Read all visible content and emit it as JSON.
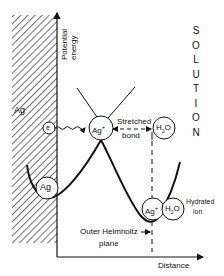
{
  "diagram": {
    "type": "potential energy diagram",
    "axes": {
      "y_label": [
        "Potential",
        "energy"
      ],
      "x_label": "Distance"
    },
    "regions": {
      "metal_label": "Ag",
      "solution_label": "SOLUTION",
      "solution_letters": [
        "S",
        "O",
        "L",
        "U",
        "T",
        "I",
        "O",
        "N"
      ]
    },
    "particles": {
      "electron": "e",
      "surface_atom": "Ag",
      "transition_ion": "Ag",
      "transition_ion_sup": "+",
      "water_top_main": "H",
      "water_top_sub": "2",
      "water_top_tail": "O",
      "hydrated_ion": "Ag",
      "hydrated_ion_sup": "+",
      "water_bottom_main": "H",
      "water_bottom_sub": "2",
      "water_bottom_tail": "O"
    },
    "annotations": {
      "stretched": "Stretched",
      "bond": "bond",
      "hydrated": "Hydrated",
      "ion": "ion",
      "ohp_line1": "Outer Helmholtz",
      "ohp_line2": "plane"
    },
    "colors": {
      "ink": "#111111",
      "background": "#ffffff"
    }
  }
}
